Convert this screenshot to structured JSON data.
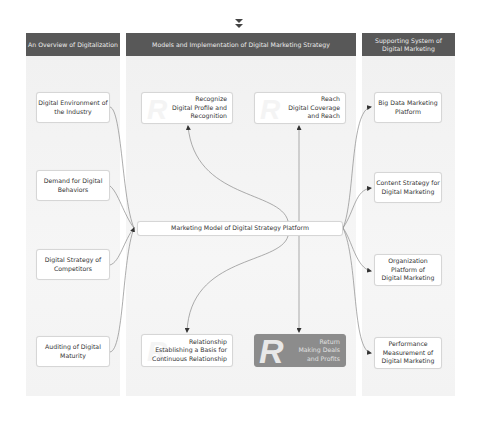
{
  "top_icon": {
    "name": "double-chevron-down-icon",
    "glyph": "▼\n▼"
  },
  "columns": [
    {
      "id": "overview",
      "header": "An Overview of Digitalization"
    },
    {
      "id": "models",
      "header": "Models and Implementation of Digital Marketing Strategy"
    },
    {
      "id": "support",
      "header": "Supporting System of\nDigital Marketing"
    }
  ],
  "left_nodes": [
    {
      "label": "Digital Environment of\nthe Industry"
    },
    {
      "label": "Demand for Digital\nBehaviors"
    },
    {
      "label": "Digital Strategy of\nCompetitors"
    },
    {
      "label": "Auditing of Digital\nMaturity"
    }
  ],
  "center_node": {
    "label": "Marketing Model of Digital Strategy Platform"
  },
  "model_nodes": [
    {
      "letter": "R",
      "label": "Recognize\nDigital Profile and\nRecognition",
      "style": "light"
    },
    {
      "letter": "R",
      "label": "Reach\nDigital Coverage\nand Reach",
      "style": "light"
    },
    {
      "letter": "R",
      "label": "Relationship\nEstablishing a Basis for\nContinuous Relationship",
      "style": "light"
    },
    {
      "letter": "R",
      "label": "Return\nMaking Deals\nand Profits",
      "style": "dark"
    }
  ],
  "right_nodes": [
    {
      "label": "Big Data Marketing\nPlatform"
    },
    {
      "label": "Content Strategy for\nDigital Marketing"
    },
    {
      "label": "Organization\nPlatform of\nDigital Marketing"
    },
    {
      "label": "Performance\nMeasurement of\nDigital Marketing"
    }
  ],
  "colors": {
    "header_bg": "#585858",
    "column_bg": "#f3f3f3",
    "node_border": "#d6d6d6",
    "highlight_node_bg": "#8c8c8c",
    "connector": "#8a8a8a"
  }
}
